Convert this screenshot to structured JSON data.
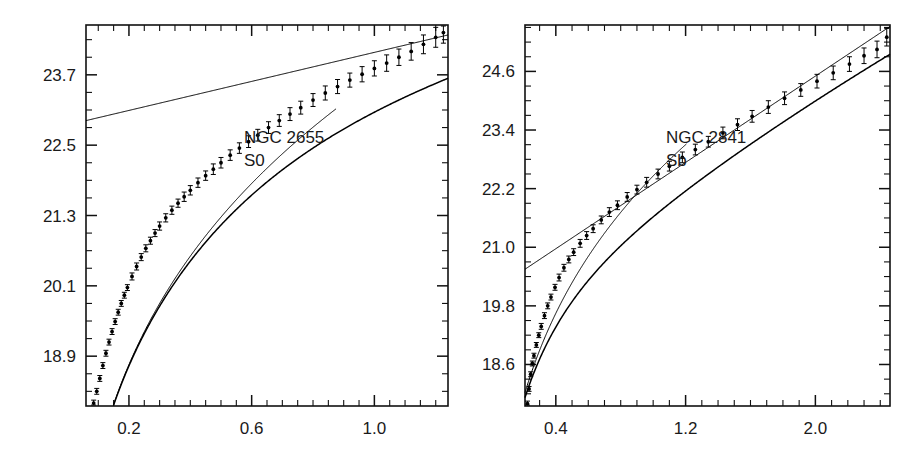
{
  "figure": {
    "background_color": "#ffffff",
    "ink_color": "#000000",
    "panel_count": 2
  },
  "chart_data": [
    {
      "type": "scatter",
      "id": "ngc2655",
      "title": "NGC 2655",
      "subtitle": "S0",
      "annotations": [
        "NGC 2655",
        "S0"
      ],
      "xlabel": "",
      "ylabel": "",
      "xlim": [
        0.06,
        1.24
      ],
      "ylim": [
        24.55,
        18.05
      ],
      "y_inverted": true,
      "grid": false,
      "legend": "none",
      "xticks": [
        0.2,
        0.6,
        1.0
      ],
      "xtick_labels": [
        "0.2",
        "0.6",
        "1.0"
      ],
      "xtick_major_step": 0.2,
      "xtick_minor_step": 0.05,
      "yticks": [
        18.9,
        20.1,
        21.3,
        22.5,
        23.7
      ],
      "ytick_labels": [
        "18.9",
        "20.1",
        "21.3",
        "22.5",
        "23.7"
      ],
      "ytick_major_step": 1.2,
      "ytick_minor_step": 0.3,
      "series": [
        {
          "name": "observed-profile",
          "style": "points-with-errorbars",
          "x": [
            0.085,
            0.095,
            0.105,
            0.115,
            0.125,
            0.135,
            0.145,
            0.155,
            0.165,
            0.175,
            0.185,
            0.195,
            0.21,
            0.225,
            0.24,
            0.255,
            0.27,
            0.285,
            0.3,
            0.32,
            0.34,
            0.36,
            0.38,
            0.4,
            0.425,
            0.45,
            0.475,
            0.5,
            0.53,
            0.56,
            0.59,
            0.62,
            0.655,
            0.69,
            0.725,
            0.76,
            0.8,
            0.84,
            0.88,
            0.92,
            0.96,
            1.0,
            1.04,
            1.08,
            1.12,
            1.16,
            1.2,
            1.225
          ],
          "y": [
            18.1,
            18.3,
            18.52,
            18.74,
            18.95,
            19.14,
            19.32,
            19.49,
            19.65,
            19.8,
            19.94,
            20.07,
            20.26,
            20.43,
            20.59,
            20.74,
            20.87,
            21.0,
            21.12,
            21.26,
            21.39,
            21.51,
            21.62,
            21.73,
            21.86,
            21.98,
            22.09,
            22.2,
            22.33,
            22.45,
            22.56,
            22.67,
            22.8,
            22.92,
            23.03,
            23.14,
            23.27,
            23.39,
            23.5,
            23.61,
            23.71,
            23.81,
            23.9,
            24.0,
            24.1,
            24.22,
            24.34,
            24.42
          ],
          "yerr": [
            0.05,
            0.05,
            0.05,
            0.05,
            0.05,
            0.05,
            0.05,
            0.05,
            0.05,
            0.05,
            0.05,
            0.05,
            0.06,
            0.06,
            0.06,
            0.06,
            0.06,
            0.06,
            0.07,
            0.07,
            0.07,
            0.07,
            0.08,
            0.08,
            0.08,
            0.08,
            0.09,
            0.09,
            0.09,
            0.09,
            0.1,
            0.1,
            0.1,
            0.1,
            0.11,
            0.11,
            0.11,
            0.12,
            0.12,
            0.12,
            0.13,
            0.13,
            0.14,
            0.14,
            0.15,
            0.16,
            0.17,
            0.18
          ]
        },
        {
          "name": "total-fit",
          "style": "line",
          "description": "bulge plus disk model fit through the data"
        },
        {
          "name": "bulge-component",
          "style": "line",
          "description": "r^1/4 bulge component, steeply falling, reaches frame bottom near x=0.87"
        },
        {
          "name": "disk-component",
          "style": "line",
          "description": "exponential disk component, straight line from 22.95 at x=0.085 to 24.35 at x=1.24"
        }
      ]
    },
    {
      "type": "scatter",
      "id": "ngc2841",
      "title": "NGC 2841",
      "subtitle": "Sb",
      "annotations": [
        "NGC 2841",
        "Sb"
      ],
      "xlabel": "",
      "ylabel": "",
      "xlim": [
        0.21,
        2.46
      ],
      "ylim": [
        25.55,
        17.75
      ],
      "y_inverted": true,
      "grid": false,
      "legend": "none",
      "xticks": [
        0.4,
        1.2,
        2.0
      ],
      "xtick_labels": [
        "0.4",
        "1.2",
        "2.0"
      ],
      "xtick_major_step": 0.4,
      "xtick_minor_step": 0.1,
      "yticks": [
        18.6,
        19.8,
        21.0,
        22.2,
        23.4,
        24.6
      ],
      "ytick_labels": [
        "18.6",
        "19.8",
        "21.0",
        "22.2",
        "23.4",
        "24.6"
      ],
      "ytick_major_step": 1.2,
      "ytick_minor_step": 0.3,
      "series": [
        {
          "name": "observed-profile",
          "style": "points-with-errorbars",
          "x": [
            0.225,
            0.235,
            0.245,
            0.255,
            0.265,
            0.28,
            0.295,
            0.31,
            0.33,
            0.35,
            0.37,
            0.395,
            0.42,
            0.45,
            0.48,
            0.51,
            0.55,
            0.59,
            0.63,
            0.68,
            0.73,
            0.78,
            0.84,
            0.9,
            0.96,
            1.03,
            1.1,
            1.18,
            1.26,
            1.34,
            1.43,
            1.52,
            1.61,
            1.71,
            1.81,
            1.91,
            2.01,
            2.11,
            2.21,
            2.3,
            2.38,
            2.44
          ],
          "y": [
            17.8,
            18.1,
            18.4,
            18.62,
            18.78,
            19.0,
            19.2,
            19.38,
            19.6,
            19.8,
            19.98,
            20.18,
            20.38,
            20.58,
            20.75,
            20.9,
            21.08,
            21.24,
            21.38,
            21.56,
            21.72,
            21.86,
            22.03,
            22.18,
            22.33,
            22.5,
            22.66,
            22.84,
            23.0,
            23.16,
            23.34,
            23.51,
            23.68,
            23.87,
            24.05,
            24.22,
            24.4,
            24.57,
            24.75,
            24.92,
            25.05,
            25.3
          ],
          "yerr": [
            0.05,
            0.05,
            0.05,
            0.05,
            0.05,
            0.05,
            0.05,
            0.06,
            0.06,
            0.06,
            0.06,
            0.06,
            0.07,
            0.07,
            0.07,
            0.07,
            0.08,
            0.08,
            0.08,
            0.08,
            0.09,
            0.09,
            0.09,
            0.09,
            0.1,
            0.1,
            0.1,
            0.11,
            0.11,
            0.11,
            0.12,
            0.12,
            0.12,
            0.13,
            0.13,
            0.13,
            0.14,
            0.14,
            0.15,
            0.16,
            0.17,
            0.18
          ]
        },
        {
          "name": "total-fit",
          "style": "line",
          "description": "bulge plus disk model fit through the data"
        },
        {
          "name": "bulge-component",
          "style": "line",
          "description": "r^1/4 bulge component, steeply falling, reaches frame bottom near x=1.2"
        },
        {
          "name": "disk-component",
          "style": "line",
          "description": "exponential disk component, straight line from 20.55 at x=0.21 down to frame edge"
        }
      ]
    }
  ]
}
